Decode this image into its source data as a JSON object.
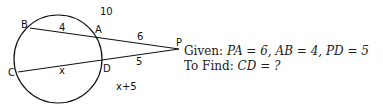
{
  "diagram": {
    "type": "secant-secant circle diagram",
    "points": {
      "B": "B",
      "A": "A",
      "P": "P",
      "C": "C",
      "D": "D"
    },
    "segment_labels": {
      "AB": "4",
      "PA": "6",
      "PB_total": "10",
      "CD": "x",
      "PD": "5",
      "PC_total": "x+5"
    }
  },
  "problem": {
    "given_label": "Given:",
    "given_text": "PA = 6, AB = 4, PD = 5",
    "find_label": "To Find:",
    "find_text": "CD = ?"
  }
}
